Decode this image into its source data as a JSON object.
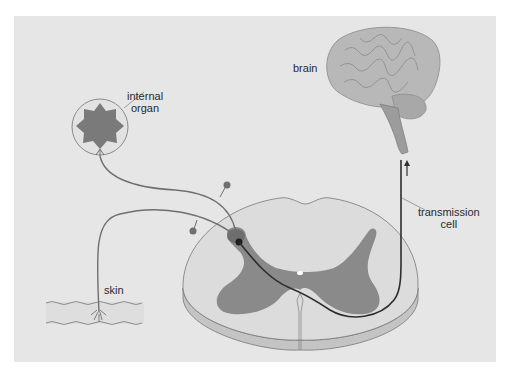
{
  "diagram": {
    "type": "pain-pathway",
    "labels": {
      "internal_organ_line1": "internal",
      "internal_organ_line2": "organ",
      "brain": "brain",
      "transmission_line1": "transmission",
      "transmission_line2": "cell",
      "skin": "skin"
    },
    "colors": {
      "panel": "#e6e6e6",
      "gray_matter": "#8a8a8a",
      "white_matter": "#dcdcdc",
      "nerve": "#6f6f6f",
      "transmission_cell": "#2e2e2e",
      "brain": "#b5b5b5"
    }
  }
}
